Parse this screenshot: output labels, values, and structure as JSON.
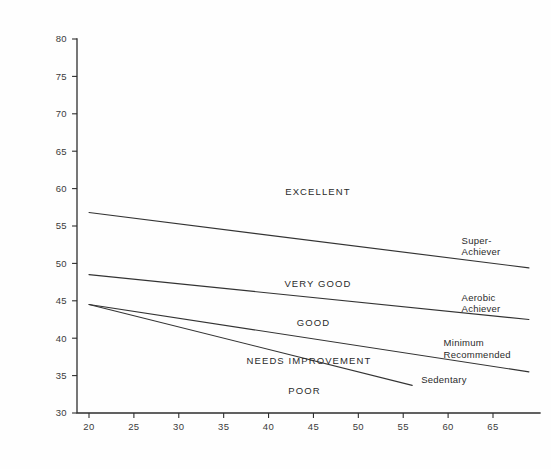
{
  "chart_data": {
    "type": "line",
    "title": "",
    "subtitle": "",
    "xlabel": "",
    "ylabel": "",
    "xlim": [
      18,
      69
    ],
    "ylim": [
      30,
      80
    ],
    "x_ticks": [
      20,
      25,
      30,
      35,
      40,
      45,
      50,
      55,
      60,
      65
    ],
    "y_ticks": [
      30,
      35,
      40,
      45,
      50,
      55,
      60,
      65,
      70,
      75,
      80
    ],
    "grid": false,
    "legend": "inline-end-labels",
    "line_color": "#333333",
    "axis_color": "#2e2e2e",
    "background": "#fefefe",
    "series": [
      {
        "name": "Super-Achiever",
        "label_lines": [
          "Super-",
          "Achiever"
        ],
        "x": [
          20,
          69
        ],
        "y": [
          56.8,
          49.4
        ],
        "label_x": 61.5,
        "label_y": 52.6
      },
      {
        "name": "Aerobic Achiever",
        "label_lines": [
          "Aerobic",
          "Achiever"
        ],
        "x": [
          20,
          69
        ],
        "y": [
          48.5,
          42.5
        ],
        "label_x": 61.5,
        "label_y": 45.0
      },
      {
        "name": "Minimum Recommended",
        "label_lines": [
          "Minimum",
          "Recommended"
        ],
        "x": [
          20,
          69
        ],
        "y": [
          44.5,
          35.5
        ],
        "label_x": 59.5,
        "label_y": 38.9
      },
      {
        "name": "Sedentary",
        "label_lines": [
          "Sedentary"
        ],
        "x": [
          20,
          56
        ],
        "y": [
          44.5,
          33.7
        ],
        "label_x": 57.0,
        "label_y": 34.0
      }
    ],
    "zones": [
      {
        "name": "EXCELLENT",
        "label": "EXCELLENT",
        "x": 45.5,
        "y": 59.2
      },
      {
        "name": "VERY GOOD",
        "label": "VERY GOOD",
        "x": 45.5,
        "y": 46.8
      },
      {
        "name": "GOOD",
        "label": "GOOD",
        "x": 45.0,
        "y": 41.6
      },
      {
        "name": "NEEDS IMPROVEMENT",
        "label": "NEEDS IMPROVEMENT",
        "x": 44.5,
        "y": 36.6
      },
      {
        "name": "POOR",
        "label": "POOR",
        "x": 44.0,
        "y": 32.6
      }
    ]
  }
}
